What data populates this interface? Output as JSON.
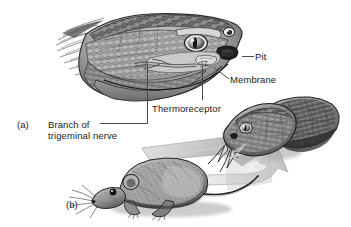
{
  "figure": {
    "background_color": "#ffffff",
    "text_color": "#1a1a1a",
    "leader_color": "#4a4a4a",
    "width": 351,
    "height": 227
  },
  "panels": [
    {
      "id": "a",
      "letter": "(a)",
      "description": "Cut-away illustration of a pit viper head showing the facial pit organ anatomy"
    },
    {
      "id": "b",
      "letter": "(b)",
      "description": "Pit viper detecting the infrared heat signature radiating from a mouse"
    }
  ],
  "labels": {
    "pit": "Pit",
    "membrane": "Membrane",
    "thermoreceptor": "Thermoreceptor",
    "branch_line1": "Branch of",
    "branch_line2": "trigeminal nerve"
  },
  "artwork": {
    "snake_head_a": "snake-head-cutaway-illustration",
    "snake_head_b": "snake-head-striking-illustration",
    "mouse": "mouse-illustration",
    "heat_cones": "infrared-heat-cone-shapes"
  },
  "colors": {
    "ink_dark": "#1f1f1f",
    "ink_mid": "#6e6e6e",
    "scale_light": "#c9c9c9",
    "scale_mid": "#9a9a9a",
    "heat_cone": "#b5b5b5",
    "heat_cone_light": "#cfcfcf",
    "shadow": "#8a8a8a"
  }
}
